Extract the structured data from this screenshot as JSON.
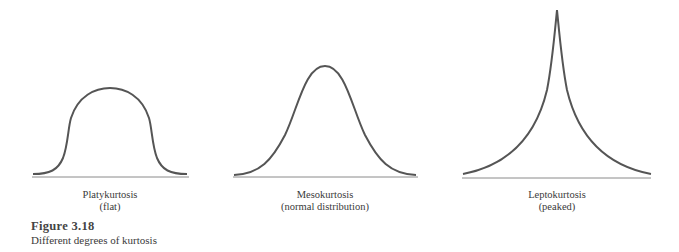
{
  "figure": {
    "number": "Figure 3.18",
    "caption": "Different degrees of kurtosis"
  },
  "panels": [
    {
      "name": "Platykurtosis",
      "subtitle": "(flat)"
    },
    {
      "name": "Mesokurtosis",
      "subtitle": "(normal distribution)"
    },
    {
      "name": "Leptokurtosis",
      "subtitle": "(peaked)"
    }
  ],
  "colors": {
    "curve": "#555555",
    "axis": "#888888",
    "text": "#3a3a3a"
  }
}
